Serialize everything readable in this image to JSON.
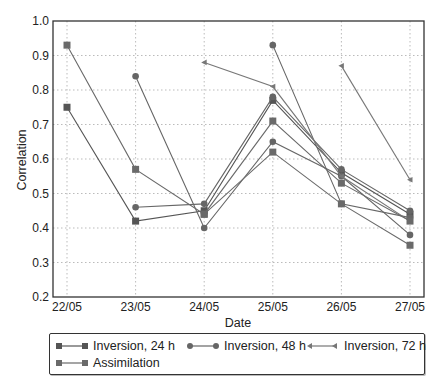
{
  "chart_data": {
    "type": "line",
    "title": "",
    "xlabel": "Date",
    "ylabel": "Correlation",
    "categories": [
      "22/05",
      "23/05",
      "24/05",
      "25/05",
      "26/05",
      "27/05"
    ],
    "ylim": [
      0.2,
      1.0
    ],
    "yticks": [
      0.2,
      0.3,
      0.4,
      0.5,
      0.6,
      0.7,
      0.8,
      0.9,
      1.0
    ],
    "grid": true,
    "legend_position": "bottom",
    "series": [
      {
        "name": "Inversion, 24 h",
        "marker": "square",
        "segments": [
          [
            [
              "22/05",
              0.75
            ],
            [
              "23/05",
              0.42
            ],
            [
              "24/05",
              0.45
            ],
            [
              "25/05",
              0.77
            ],
            [
              "26/05",
              0.56
            ],
            [
              "27/05",
              0.44
            ]
          ]
        ]
      },
      {
        "name": "Inversion, 48 h",
        "marker": "circle",
        "segments": [
          [
            [
              "23/05",
              0.84
            ],
            [
              "24/05",
              0.4
            ],
            [
              "25/05",
              0.65
            ],
            [
              "26/05",
              0.55
            ],
            [
              "27/05",
              0.38
            ]
          ],
          [
            [
              "23/05",
              0.46
            ],
            [
              "24/05",
              0.47
            ],
            [
              "25/05",
              0.78
            ],
            [
              "26/05",
              0.57
            ],
            [
              "27/05",
              0.45
            ]
          ],
          [
            [
              "25/05",
              0.93
            ],
            [
              "26/05",
              0.47
            ],
            [
              "27/05",
              0.43
            ]
          ]
        ]
      },
      {
        "name": "Inversion, 72 h",
        "marker": "triangle-left",
        "segments": [
          [
            [
              "24/05",
              0.88
            ],
            [
              "25/05",
              0.81
            ],
            [
              "26/05",
              0.55
            ],
            [
              "27/05",
              0.42
            ]
          ],
          [
            [
              "26/05",
              0.87
            ],
            [
              "27/05",
              0.54
            ]
          ]
        ]
      },
      {
        "name": "Assimilation",
        "marker": "square",
        "segments": [
          [
            [
              "22/05",
              0.93
            ],
            [
              "23/05",
              0.57
            ],
            [
              "24/05",
              0.44
            ],
            [
              "25/05",
              0.71
            ],
            [
              "26/05",
              0.53
            ],
            [
              "27/05",
              0.42
            ]
          ],
          [
            [
              "24/05",
              0.44
            ],
            [
              "25/05",
              0.62
            ],
            [
              "26/05",
              0.47
            ],
            [
              "27/05",
              0.35
            ]
          ]
        ]
      }
    ]
  },
  "legend": {
    "items": [
      "Inversion, 24 h",
      "Inversion, 48 h",
      "Inversion, 72 h",
      "Assimilation"
    ]
  },
  "colors": {
    "series": [
      "#555555",
      "#666666",
      "#777777",
      "#6a6a6a"
    ],
    "grid": "#aaaaaa",
    "axis": "#333333"
  }
}
